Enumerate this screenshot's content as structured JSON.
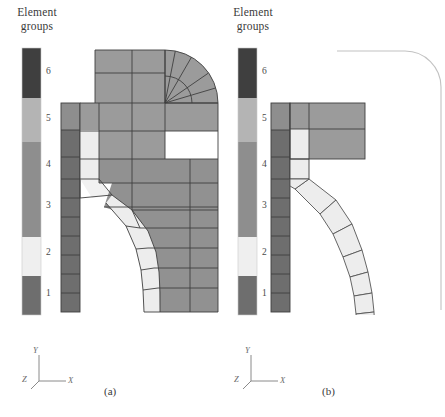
{
  "figure": {
    "type": "finite-element-mesh-diagram",
    "background": "#ffffff",
    "width": 445,
    "height": 417
  },
  "legend": {
    "title": "Element\ngroups",
    "title_line1": "Element",
    "title_line2": "groups",
    "orientation": "vertical",
    "labels": [
      "6",
      "5",
      "4",
      "3",
      "2",
      "1"
    ],
    "bands": [
      {
        "label": "6",
        "color": "#3f3f3f"
      },
      {
        "label": "5",
        "color": "#b4b4b4"
      },
      {
        "label": "4",
        "color": "#8e8e8e"
      },
      {
        "label": "3",
        "color": "#8e8e8e"
      },
      {
        "label": "2",
        "color": "#efefef"
      },
      {
        "label": "1",
        "color": "#6e6e6e"
      }
    ]
  },
  "palette": {
    "group6_darkest": "#3f3f3f",
    "group5_light": "#b4b4b4",
    "group4_mid": "#8e8e8e",
    "group3_mid": "#8e8e8e",
    "group2_pale": "#efefef",
    "group1_dark": "#6e6e6e",
    "mesh_line": "#4a4a4a",
    "outline_thin": "#b9b9b9",
    "text": "#3b3b3b"
  },
  "panels": [
    {
      "id": "a",
      "label": "(a)",
      "caption": "(a)",
      "description": "Undeformed fine finite-element mesh of axisymmetric vessel with toroidal knuckle and cylindrical shell",
      "axes": {
        "y": "Y",
        "x": "X",
        "z": "Z"
      }
    },
    {
      "id": "b",
      "label": "(b)",
      "caption": "(b)",
      "description": "Coarse finite-element mesh of same vessel with reference outline curve",
      "axes": {
        "y": "Y",
        "x": "X",
        "z": "Z"
      }
    }
  ],
  "axis_triads": [
    {
      "panel": "a",
      "y_label": "Y",
      "x_label": "X",
      "z_label": "Z"
    },
    {
      "panel": "b",
      "y_label": "Y",
      "x_label": "X",
      "z_label": "Z"
    }
  ]
}
